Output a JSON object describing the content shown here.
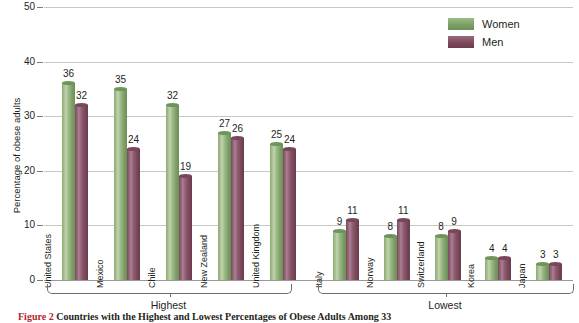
{
  "chart_data": {
    "type": "bar",
    "title": "",
    "xlabel": "",
    "ylabel": "Percentage of obese adults",
    "ylim": [
      0,
      50
    ],
    "yticks": [
      0,
      10,
      20,
      30,
      40,
      50
    ],
    "ytick_labels": [
      "0",
      "10",
      "20",
      "30",
      "40",
      "50"
    ],
    "grid": true,
    "legend_position": "top-right",
    "categories": [
      "United States",
      "Mexico",
      "Chile",
      "New Zealand",
      "United Kingdom",
      "Italy",
      "Norway",
      "Switzerland",
      "Korea",
      "Japan"
    ],
    "series": [
      {
        "name": "Women",
        "color": "#7d9f66",
        "values": [
          36,
          35,
          32,
          27,
          25,
          9,
          8,
          8,
          4,
          3
        ]
      },
      {
        "name": "Men",
        "color": "#7d4a5c",
        "values": [
          32,
          24,
          19,
          26,
          24,
          11,
          11,
          9,
          4,
          3
        ]
      }
    ],
    "groups": [
      {
        "label": "Highest",
        "categories": [
          "United States",
          "Mexico",
          "Chile",
          "New Zealand",
          "United Kingdom"
        ]
      },
      {
        "label": "Lowest",
        "categories": [
          "Italy",
          "Norway",
          "Switzerland",
          "Korea",
          "Japan"
        ]
      }
    ],
    "annotations": {
      "caption_number": "Figure 2",
      "caption_text": "Countries with the Highest and Lowest Percentages of Obese Adults Among 33"
    }
  },
  "legend": {
    "items": [
      {
        "label": "Women",
        "key": "women"
      },
      {
        "label": "Men",
        "key": "men"
      }
    ]
  },
  "caption": {
    "number": "Figure 2",
    "text": "Countries with the Highest and Lowest Percentages of Obese Adults Among 33"
  },
  "colors": {
    "women": "#7d9f66",
    "men": "#7d4a5c",
    "gridline": "#c9c6c3",
    "caption_number": "#b8242a",
    "text": "#231f20"
  }
}
